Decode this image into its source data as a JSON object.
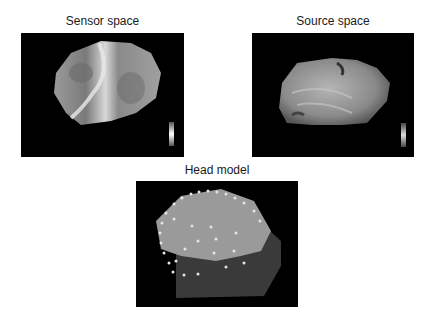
{
  "panels": [
    {
      "id": "sensor",
      "title": "Sensor space",
      "description": "EEG topography on sensor surface, grayscale",
      "colorbar": "grayscale"
    },
    {
      "id": "source",
      "title": "Source space",
      "description": "Cortical surface rendering, grayscale",
      "colorbar": "grayscale"
    },
    {
      "id": "head",
      "title": "Head model",
      "description": "Head mesh with electrode positions",
      "electrode_color": "#e0e0e0"
    }
  ],
  "colors": {
    "background": "#ffffff",
    "panel_bg": "#000000",
    "text": "#1a1a1a"
  }
}
